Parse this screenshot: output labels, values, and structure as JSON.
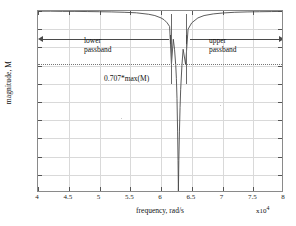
{
  "figure": {
    "kind": "matlab-figure",
    "background": "#ffffff",
    "frame_color": "#8a8a8a",
    "grid_color": "#d9d9d9",
    "curve_color": "#4a4a4a",
    "marker_color": "#6a6a6a"
  },
  "chart_data": {
    "type": "line",
    "title": "",
    "xlabel": "frequency, rad/s",
    "ylabel": "magnitude, M",
    "x_exponent_label": "x10",
    "x_exponent_power": "4",
    "xlim": [
      4,
      8
    ],
    "ylim": [
      0,
      1
    ],
    "grid": true,
    "legend": null,
    "xticks": [
      4,
      4.5,
      5,
      5.5,
      6,
      6.5,
      7,
      7.5,
      8
    ],
    "xticklabels": [
      "4",
      "4.5",
      "5",
      "5.5",
      "6",
      "6.5",
      "7",
      "7.5",
      "8"
    ],
    "yticks": [
      0,
      0.1,
      0.2,
      0.3,
      0.4,
      0.5,
      0.6,
      0.7,
      0.8,
      0.9,
      1
    ],
    "yticklabels": [
      "0",
      "0.1",
      "0.2",
      "0.3",
      "0.4",
      "0.5",
      "0.6",
      "0.7",
      "0.8",
      "0.9",
      "1"
    ],
    "series": [
      {
        "name": "magnitude M",
        "x": [
          4.0,
          4.2,
          4.4,
          4.6,
          4.8,
          5.0,
          5.2,
          5.4,
          5.6,
          5.8,
          5.9,
          6.0,
          6.05,
          6.1,
          6.14,
          6.17,
          6.2,
          6.22,
          6.24,
          6.25,
          6.26,
          6.27,
          6.277,
          6.283,
          6.29,
          6.3,
          6.31,
          6.32,
          6.34,
          6.36,
          6.4,
          6.44,
          6.5,
          6.6,
          6.7,
          6.85,
          7.0,
          7.2,
          7.4,
          7.6,
          7.8,
          8.0
        ],
        "y": [
          0.999,
          0.999,
          0.998,
          0.998,
          0.997,
          0.996,
          0.995,
          0.993,
          0.99,
          0.982,
          0.975,
          0.962,
          0.952,
          0.935,
          0.915,
          0.707,
          0.845,
          0.79,
          0.7,
          0.63,
          0.52,
          0.34,
          0.18,
          0.01,
          0.18,
          0.34,
          0.47,
          0.57,
          0.7,
          0.79,
          0.707,
          0.9,
          0.935,
          0.962,
          0.975,
          0.984,
          0.989,
          0.993,
          0.995,
          0.996,
          0.997,
          0.998
        ]
      }
    ],
    "reference_lines": [
      {
        "name": "half-power-line",
        "orientation": "horizontal",
        "value": 0.707,
        "style": "dotted",
        "label": "0.707*max(M)"
      },
      {
        "name": "lower-cutoff-marker",
        "orientation": "vertical",
        "value": 6.17,
        "style": "solid"
      },
      {
        "name": "upper-cutoff-marker",
        "orientation": "vertical",
        "value": 6.4,
        "style": "solid"
      }
    ],
    "annotations": [
      {
        "name": "lower-passband",
        "text": "lower\npassband",
        "arrow": "double-left",
        "x_from": 4.0,
        "x_to": 6.17,
        "y": 0.845
      },
      {
        "name": "upper-passband",
        "text": "upper\npassband",
        "arrow": "double-right",
        "x_from": 6.4,
        "x_to": 8.0,
        "y": 0.845
      },
      {
        "name": "half-power-label",
        "text": "0.707*max(M)",
        "x": 5.1,
        "y": 0.63
      }
    ]
  },
  "labels": {
    "lower_passband": "lower\npassband",
    "upper_passband": "upper\npassband",
    "half_power": "0.707*max(M)"
  }
}
